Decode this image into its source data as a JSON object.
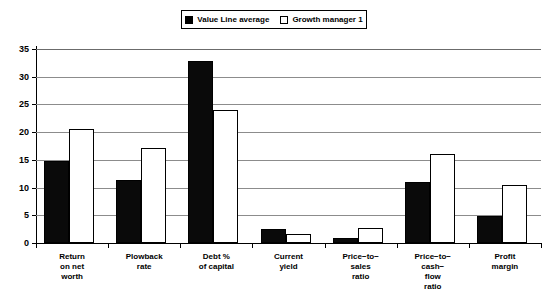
{
  "legend": {
    "entries": [
      {
        "label": "Value Line average",
        "swatch": "filled-square-icon",
        "color": "#000000"
      },
      {
        "label": "Growth manager 1",
        "swatch": "open-square-icon",
        "color": "#ffffff"
      }
    ]
  },
  "axis": {
    "y_ticks": [
      "0",
      "5",
      "10",
      "15",
      "20",
      "25",
      "30",
      "35"
    ]
  },
  "chart_data": {
    "type": "bar",
    "title": "",
    "xlabel": "",
    "ylabel": "",
    "ylim": [
      0,
      35
    ],
    "ytick_step": 5,
    "grid": true,
    "legend_position": "top-center",
    "categories": [
      "Return\non net\nworth",
      "Plowback\nrate",
      "Debt %\nof capital",
      "Current\nyield",
      "Price−to−\nsales\nratio",
      "Price−to−\ncash−\nflow\nratio",
      "Profit\nmargin"
    ],
    "series": [
      {
        "name": "Value Line average",
        "color": "#000000",
        "values": [
          14.8,
          11.3,
          32.8,
          2.6,
          0.9,
          11.0,
          4.8
        ]
      },
      {
        "name": "Growth manager 1",
        "color": "#ffffff",
        "values": [
          20.6,
          17.2,
          24.0,
          1.6,
          2.7,
          16.0,
          10.5
        ]
      }
    ]
  }
}
